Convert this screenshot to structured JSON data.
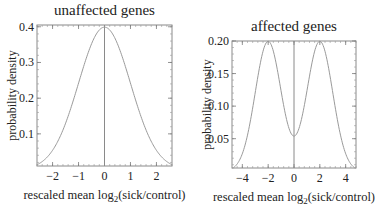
{
  "chart_data": [
    {
      "type": "line",
      "title": "unaffected genes",
      "xlabel": "rescaled mean log2(sick/control)",
      "xlabel_main": "rescaled mean log",
      "xlabel_sub": "2",
      "xlabel_tail": "(sick/control)",
      "ylabel": "probability density",
      "xlim": [
        -2.6,
        2.6
      ],
      "ylim": [
        0.01,
        0.405
      ],
      "xticks": [
        -2,
        -1,
        0,
        1,
        2
      ],
      "xtick_labels": [
        "−2",
        "−1",
        "0",
        "1",
        "2"
      ],
      "yticks": [
        0.1,
        0.2,
        0.3,
        0.4
      ],
      "ytick_labels": [
        "0.1",
        "0.2",
        "0.3",
        "0.4"
      ],
      "series": [
        {
          "name": "standard normal density",
          "distribution": "N(0,1)",
          "x": [
            -2.6,
            -2,
            -1.5,
            -1,
            -0.5,
            0,
            0.5,
            1,
            1.5,
            2,
            2.6
          ],
          "y": [
            0.0136,
            0.054,
            0.1295,
            0.242,
            0.352,
            0.399,
            0.352,
            0.242,
            0.1295,
            0.054,
            0.0136
          ]
        }
      ],
      "vertical_line_x": 0,
      "grid": false
    },
    {
      "type": "line",
      "title": "affected genes",
      "xlabel": "rescaled mean log2(sick/control)",
      "xlabel_main": "rescaled mean log",
      "xlabel_sub": "2",
      "xlabel_tail": "(sick/control)",
      "ylabel": "probability density",
      "xlim": [
        -4.8,
        4.8
      ],
      "ylim": [
        0.005,
        0.2
      ],
      "xticks": [
        -4,
        -2,
        0,
        2,
        4
      ],
      "xtick_labels": [
        "−4",
        "−2",
        "0",
        "2",
        "4"
      ],
      "yticks": [
        0.05,
        0.1,
        0.15,
        0.2
      ],
      "ytick_labels": [
        "0.05",
        "0.10",
        "0.15",
        "0.20"
      ],
      "series": [
        {
          "name": "bimodal mixture density",
          "distribution": "0.5*N(-2,1)+0.5*N(2,1)",
          "x": [
            -4.8,
            -4,
            -3,
            -2,
            -1,
            0,
            1,
            2,
            3,
            4,
            4.8
          ],
          "y": [
            0.004,
            0.027,
            0.121,
            0.2,
            0.122,
            0.054,
            0.122,
            0.2,
            0.121,
            0.027,
            0.004
          ]
        }
      ],
      "vertical_line_x": 0,
      "grid": false
    }
  ]
}
